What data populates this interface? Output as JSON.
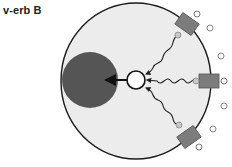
{
  "title": "v-erb B",
  "colors": {
    "cell_fill": "#ececec",
    "cell_stroke": "#1a1a1a",
    "nucleus": "#555555",
    "receptor": "#7c7c7c",
    "ligand_fill": "#ffffff",
    "ligand_stroke": "#777777",
    "docking_fill": "#c8c8c8",
    "arrow": "#111111"
  },
  "diagram": {
    "cell": {
      "label": "cell",
      "cx": 136,
      "cy": 81,
      "rx": 75,
      "ry": 78
    },
    "nucleus": {
      "label": "nucleus",
      "cx": 90,
      "cy": 80,
      "r": 28
    },
    "signal_molecule": {
      "label": "signal-molecule",
      "cx": 136,
      "cy": 80,
      "r": 9
    },
    "receptors": [
      {
        "label": "receptor-top",
        "x": 187,
        "y": 24,
        "angle": -55
      },
      {
        "label": "receptor-right",
        "x": 209,
        "y": 81,
        "angle": 0
      },
      {
        "label": "receptor-bottom",
        "x": 189,
        "y": 138,
        "angle": 55
      }
    ],
    "free_ligands": [
      {
        "cx": 210,
        "cy": 28
      },
      {
        "cx": 221,
        "cy": 56
      },
      {
        "cx": 224,
        "cy": 107
      },
      {
        "cx": 213,
        "cy": 129
      }
    ]
  }
}
